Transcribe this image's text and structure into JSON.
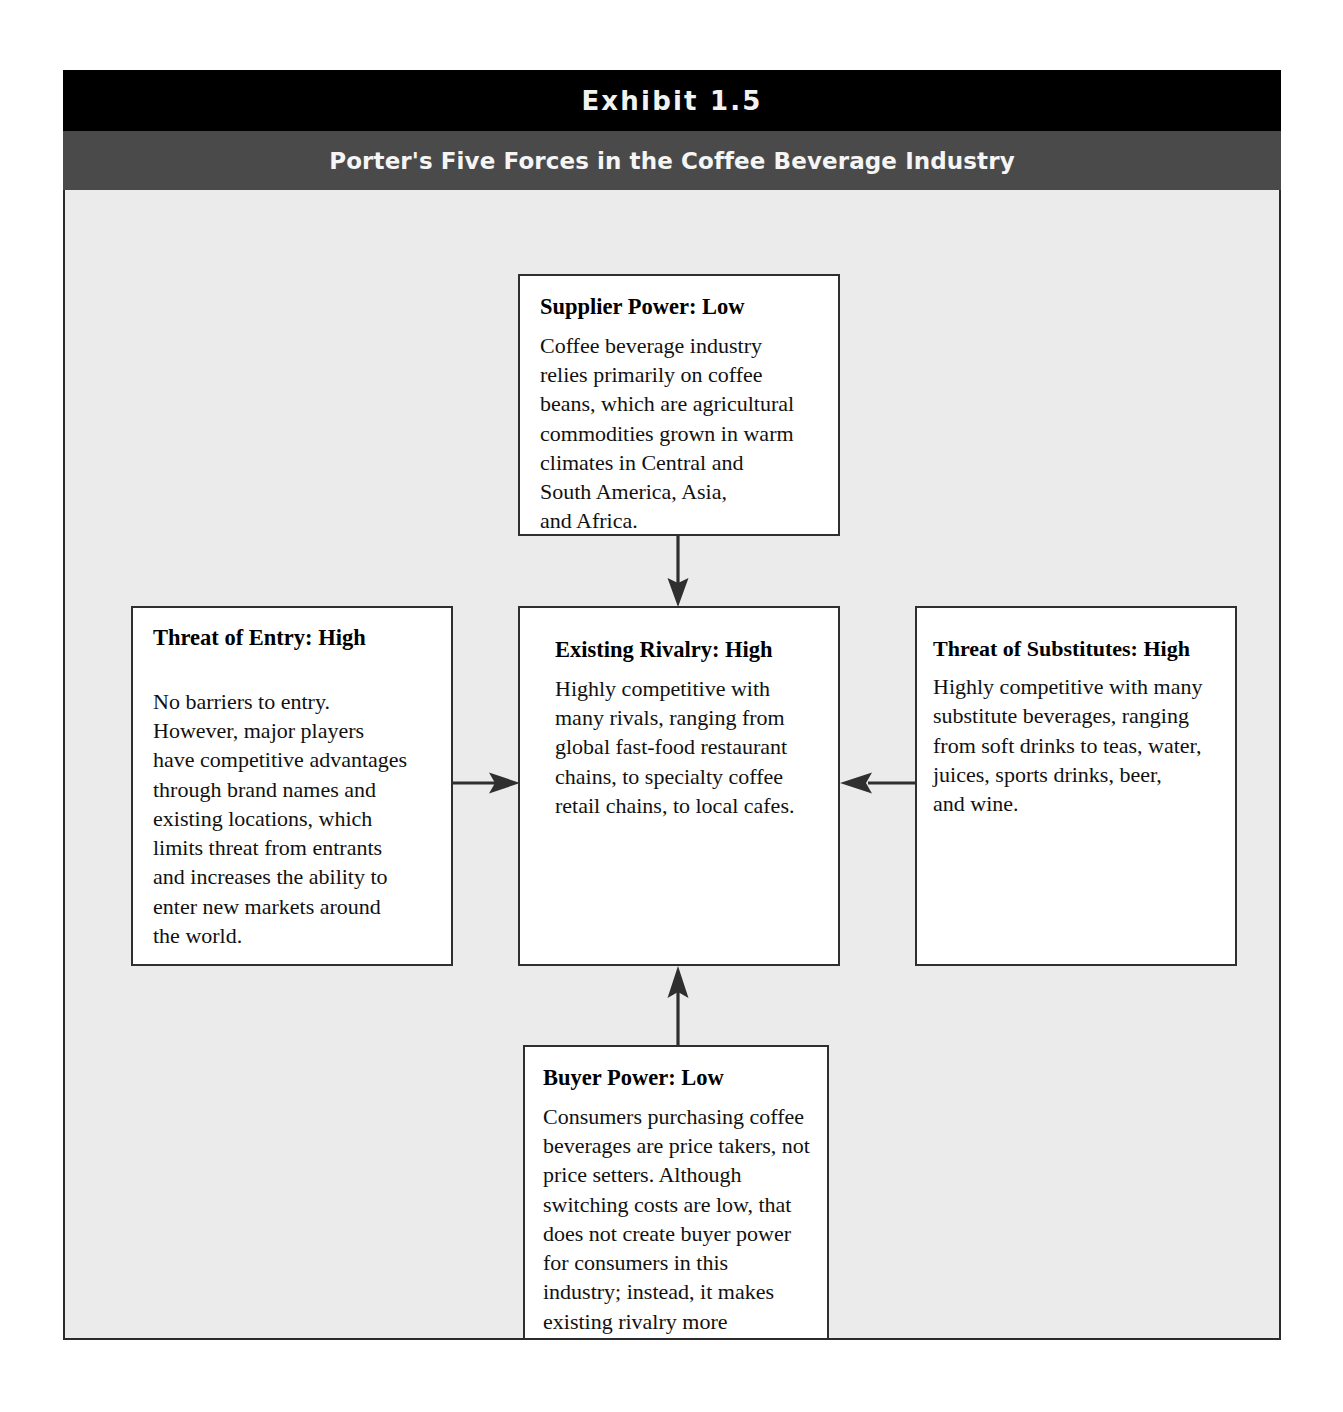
{
  "exhibit": {
    "number_label": "Exhibit 1.5",
    "subtitle": "Porter's Five Forces in the Coffee Beverage Industry"
  },
  "forces": {
    "supplier": {
      "title": "Supplier Power: Low",
      "body": "Coffee beverage industry\nrelies primarily on coffee\nbeans, which are agricultural\ncommodities grown in warm\nclimates in Central and\nSouth America, Asia,\nand Africa."
    },
    "entry": {
      "title": "Threat of Entry: High",
      "body": "No barriers to entry.\nHowever, major players\nhave competitive advantages\nthrough brand names and\nexisting locations, which\nlimits threat from entrants\nand increases the ability to\nenter new markets around\nthe world."
    },
    "rivalry": {
      "title": "Existing Rivalry: High",
      "body": "Highly competitive with\nmany rivals, ranging from\nglobal fast-food restaurant\nchains, to specialty coffee\nretail chains, to local cafes."
    },
    "substitutes": {
      "title": "Threat of Substitutes: High",
      "body": "Highly competitive with many\nsubstitute beverages, ranging\nfrom soft drinks to teas, water,\njuices, sports drinks, beer,\nand wine."
    },
    "buyer": {
      "title": "Buyer Power: Low",
      "body": "Consumers purchasing coffee\nbeverages are price takers, not\nprice setters. Although\nswitching costs are low, that\ndoes not create buyer power\nfor consumers in this\nindustry; instead, it makes\nexisting rivalry more\ncompetitive."
    }
  },
  "connections": [
    {
      "name": "supplier-to-rivalry",
      "from": "supplier",
      "to": "rivalry",
      "direction": "down"
    },
    {
      "name": "entry-to-rivalry",
      "from": "entry",
      "to": "rivalry",
      "direction": "right"
    },
    {
      "name": "substitutes-to-rivalry",
      "from": "substitutes",
      "to": "rivalry",
      "direction": "left"
    },
    {
      "name": "buyer-to-rivalry",
      "from": "buyer",
      "to": "rivalry",
      "direction": "up"
    }
  ],
  "colors": {
    "title_bar": "#000000",
    "subtitle_bar": "#4a4a4a",
    "diagram_background": "#ebebeb",
    "box_background": "#ffffff",
    "box_border": "#2f2f2f",
    "text": "#111111",
    "header_text": "#f2f2f2"
  }
}
